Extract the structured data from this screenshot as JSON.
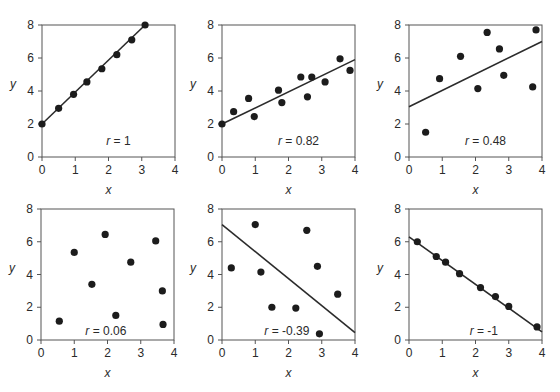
{
  "chart_data": [
    {
      "type": "scatter",
      "panel": "top-left",
      "xlabel": "x",
      "ylabel": "y",
      "xlim": [
        0,
        4
      ],
      "ylim": [
        0,
        8
      ],
      "xticks": [
        "0",
        "1",
        "2",
        "3",
        "4"
      ],
      "yticks": [
        "0",
        "2",
        "4",
        "6",
        "8"
      ],
      "annotation": "r = 1",
      "r": 1,
      "points": [
        [
          0,
          2
        ],
        [
          0.5,
          2.95
        ],
        [
          0.95,
          3.8
        ],
        [
          1.35,
          4.55
        ],
        [
          1.8,
          5.35
        ],
        [
          2.25,
          6.2
        ],
        [
          2.7,
          7.1
        ],
        [
          3.1,
          8
        ]
      ],
      "fit_line": [
        [
          0,
          2
        ],
        [
          3.1,
          8
        ]
      ]
    },
    {
      "type": "scatter",
      "panel": "top-middle",
      "xlabel": "x",
      "ylabel": "y",
      "xlim": [
        0,
        4
      ],
      "ylim": [
        0,
        8
      ],
      "xticks": [
        "0",
        "1",
        "2",
        "3",
        "4"
      ],
      "yticks": [
        "0",
        "2",
        "4",
        "6",
        "8"
      ],
      "annotation": "r = 0.82",
      "r": 0.82,
      "points": [
        [
          0,
          2
        ],
        [
          0.35,
          2.75
        ],
        [
          0.8,
          3.55
        ],
        [
          0.97,
          2.45
        ],
        [
          1.7,
          4.05
        ],
        [
          1.8,
          3.3
        ],
        [
          2.37,
          4.85
        ],
        [
          2.57,
          3.65
        ],
        [
          2.7,
          4.85
        ],
        [
          3.1,
          4.55
        ],
        [
          3.55,
          5.95
        ],
        [
          3.85,
          5.25
        ]
      ],
      "fit_line": [
        [
          0,
          2
        ],
        [
          4,
          5.9
        ]
      ]
    },
    {
      "type": "scatter",
      "panel": "top-right",
      "xlabel": "x",
      "ylabel": "y",
      "xlim": [
        0,
        4
      ],
      "ylim": [
        0,
        8
      ],
      "xticks": [
        "0",
        "1",
        "2",
        "3",
        "4"
      ],
      "yticks": [
        "0",
        "2",
        "4",
        "6",
        "8"
      ],
      "annotation": "r = 0.48",
      "r": 0.48,
      "points": [
        [
          0.5,
          1.5
        ],
        [
          0.92,
          4.75
        ],
        [
          1.55,
          6.1
        ],
        [
          2.07,
          4.15
        ],
        [
          2.35,
          7.55
        ],
        [
          2.72,
          6.55
        ],
        [
          2.85,
          4.95
        ],
        [
          3.72,
          4.25
        ],
        [
          3.82,
          7.7
        ]
      ],
      "fit_line": [
        [
          0,
          3.05
        ],
        [
          4,
          7.0
        ]
      ]
    },
    {
      "type": "scatter",
      "panel": "bottom-left",
      "xlabel": "x",
      "ylabel": "y",
      "xlim": [
        0,
        4
      ],
      "ylim": [
        0,
        8
      ],
      "xticks": [
        "0",
        "1",
        "2",
        "3",
        "4"
      ],
      "yticks": [
        "0",
        "2",
        "4",
        "6",
        "8"
      ],
      "annotation": "r = 0.06",
      "r": 0.06,
      "points": [
        [
          0.55,
          1.15
        ],
        [
          1.0,
          5.35
        ],
        [
          1.53,
          3.4
        ],
        [
          1.93,
          6.45
        ],
        [
          2.25,
          1.5
        ],
        [
          2.7,
          4.75
        ],
        [
          3.45,
          6.05
        ],
        [
          3.65,
          3.0
        ],
        [
          3.67,
          0.95
        ]
      ],
      "fit_line": null
    },
    {
      "type": "scatter",
      "panel": "bottom-middle",
      "xlabel": "x",
      "ylabel": "y",
      "xlim": [
        0,
        4
      ],
      "ylim": [
        0,
        8
      ],
      "xticks": [
        "0",
        "1",
        "2",
        "3",
        "4"
      ],
      "yticks": [
        "0",
        "2",
        "4",
        "6",
        "8"
      ],
      "annotation": "r = -0.39",
      "r": -0.39,
      "points": [
        [
          0.28,
          4.4
        ],
        [
          1.0,
          7.05
        ],
        [
          1.17,
          4.15
        ],
        [
          1.5,
          2.0
        ],
        [
          2.22,
          1.95
        ],
        [
          2.55,
          6.7
        ],
        [
          2.87,
          4.5
        ],
        [
          2.93,
          0.38
        ],
        [
          3.48,
          2.8
        ]
      ],
      "fit_line": [
        [
          0,
          7.05
        ],
        [
          4,
          0.45
        ]
      ]
    },
    {
      "type": "scatter",
      "panel": "bottom-right",
      "xlabel": "x",
      "ylabel": "y",
      "xlim": [
        0,
        4
      ],
      "ylim": [
        0,
        8
      ],
      "xticks": [
        "0",
        "1",
        "2",
        "3",
        "4"
      ],
      "yticks": [
        "0",
        "2",
        "4",
        "6",
        "8"
      ],
      "annotation": "r = -1",
      "r": -1,
      "points": [
        [
          0.25,
          6.0
        ],
        [
          0.82,
          5.1
        ],
        [
          1.1,
          4.75
        ],
        [
          1.52,
          4.05
        ],
        [
          2.15,
          3.2
        ],
        [
          2.6,
          2.65
        ],
        [
          3.0,
          2.05
        ],
        [
          3.85,
          0.8
        ]
      ],
      "fit_line": [
        [
          0,
          6.3
        ],
        [
          4,
          0.5
        ]
      ]
    }
  ],
  "layout": {
    "panels": [
      {
        "x0": 42,
        "x1": 175,
        "y0": 157,
        "y1": 25
      },
      {
        "x0": 222,
        "x1": 355,
        "y0": 157,
        "y1": 25
      },
      {
        "x0": 409,
        "x1": 542,
        "y0": 157,
        "y1": 25
      },
      {
        "x0": 41,
        "x1": 174,
        "y0": 340,
        "y1": 209
      },
      {
        "x0": 222,
        "x1": 355,
        "y0": 340,
        "y1": 209
      },
      {
        "x0": 409,
        "x1": 542,
        "y0": 340,
        "y1": 209
      }
    ],
    "annotation_pos": [
      [
        2.3,
        1.0
      ],
      [
        2.3,
        1.0
      ],
      [
        2.3,
        1.0
      ],
      [
        1.95,
        0.55
      ],
      [
        1.95,
        0.55
      ],
      [
        2.25,
        0.55
      ]
    ]
  },
  "colors": {
    "point": "#1c1c1c",
    "line": "#2b2b2b",
    "axis": "#555555",
    "text": "#2a2a2a"
  }
}
